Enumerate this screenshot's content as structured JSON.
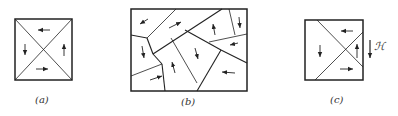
{
  "figure": {
    "panels": [
      {
        "id": "a",
        "label": "(a)"
      },
      {
        "id": "b",
        "label": "(b)"
      },
      {
        "id": "c",
        "label": "(c)"
      }
    ],
    "field_label": "ℋ",
    "colors": {
      "line": "#222222",
      "background": "#ffffff"
    }
  }
}
